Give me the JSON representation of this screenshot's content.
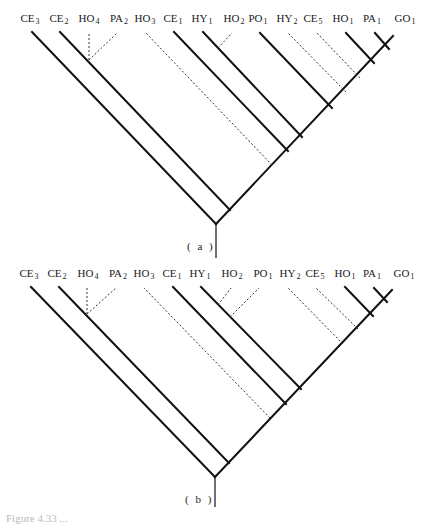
{
  "figure": {
    "panels": [
      {
        "id": "a",
        "caption": "( a )",
        "labels": [
          {
            "base": "CE",
            "sub": "3",
            "x": 30
          },
          {
            "base": "CE",
            "sub": "2",
            "x": 59
          },
          {
            "base": "HO",
            "sub": "4",
            "x": 89
          },
          {
            "base": "PA",
            "sub": "2",
            "x": 119
          },
          {
            "base": "HO",
            "sub": "3",
            "x": 145
          },
          {
            "base": "CE",
            "sub": "1",
            "x": 173
          },
          {
            "base": "HY",
            "sub": "1",
            "x": 202
          },
          {
            "base": "HO",
            "sub": "2",
            "x": 234
          },
          {
            "base": "PO",
            "sub": "1",
            "x": 258
          },
          {
            "base": "HY",
            "sub": "2",
            "x": 287
          },
          {
            "base": "CE",
            "sub": "5",
            "x": 313
          },
          {
            "base": "HO",
            "sub": "1",
            "x": 343
          },
          {
            "base": "PA",
            "sub": "1",
            "x": 372
          },
          {
            "base": "GO",
            "sub": "1",
            "x": 405
          }
        ]
      },
      {
        "id": "b",
        "caption": "( b )",
        "labels": [
          {
            "base": "CE",
            "sub": "3",
            "x": 29
          },
          {
            "base": "CE",
            "sub": "2",
            "x": 57
          },
          {
            "base": "HO",
            "sub": "4",
            "x": 88
          },
          {
            "base": "PA",
            "sub": "2",
            "x": 118
          },
          {
            "base": "HO",
            "sub": "3",
            "x": 144
          },
          {
            "base": "CE",
            "sub": "1",
            "x": 172
          },
          {
            "base": "HY",
            "sub": "1",
            "x": 200
          },
          {
            "base": "HO",
            "sub": "2",
            "x": 232
          },
          {
            "base": "PO",
            "sub": "1",
            "x": 263
          },
          {
            "base": "HY",
            "sub": "2",
            "x": 290
          },
          {
            "base": "CE",
            "sub": "5",
            "x": 315
          },
          {
            "base": "HO",
            "sub": "1",
            "x": 345
          },
          {
            "base": "PA",
            "sub": "1",
            "x": 372
          },
          {
            "base": "GO",
            "sub": "1",
            "x": 404
          }
        ]
      }
    ],
    "legend": {
      "solid_line": "solid branch",
      "dashed_line": "dashed branch"
    },
    "footer_caption": "Figure 4.33 ..."
  }
}
